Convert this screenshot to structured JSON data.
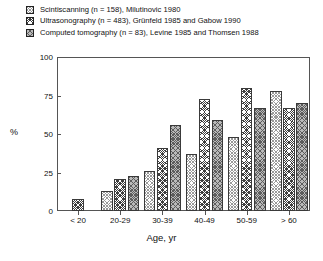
{
  "chart_data": {
    "type": "bar",
    "title": "",
    "xlabel": "Age, yr",
    "ylabel": "%",
    "ylim": [
      0,
      100
    ],
    "yticks": [
      0,
      25,
      50,
      75,
      100
    ],
    "grid": false,
    "legend_position": "top-left",
    "categories": [
      "< 20",
      "20-29",
      "30-39",
      "40-49",
      "50-59",
      "> 60"
    ],
    "series": [
      {
        "name": "Scintiscanning (n = 158), Milutinovic 1980",
        "short_name": "Scintiscanning",
        "n": 158,
        "source": "Milutinovic 1980",
        "pattern": "light-crosshatch",
        "values": [
          null,
          13,
          26,
          37,
          48,
          78
        ]
      },
      {
        "name": "Ultrasonography (n = 483), Grünfeld 1985 and Gabow 1990",
        "short_name": "Ultrasonography",
        "n": 483,
        "source": "Grünfeld 1985 and Gabow 1990",
        "pattern": "dark-crosshatch",
        "values": [
          8,
          21,
          41,
          73,
          80,
          67
        ]
      },
      {
        "name": "Computed tomography (n = 83), Levine 1985 and Thomsen 1988",
        "short_name": "Computed tomography",
        "n": 83,
        "source": "Levine 1985 and Thomsen 1988",
        "pattern": "mid-crosshatch",
        "values": [
          null,
          23,
          56,
          59,
          67,
          70
        ]
      }
    ]
  },
  "legend": {
    "items": [
      {
        "label": "Scintiscanning (n = 158), Milutinovic 1980",
        "swatch": "light-crosshatch-swatch"
      },
      {
        "label": "Ultrasonography (n = 483), Grünfeld 1985 and Gabow 1990",
        "swatch": "dark-crosshatch-swatch"
      },
      {
        "label": "Computed tomography (n = 83), Levine 1985 and Thomsen 1988",
        "swatch": "mid-crosshatch-swatch"
      }
    ]
  },
  "axes": {
    "y_title": "%",
    "x_title": "Age, yr",
    "y_tick_labels": [
      "100",
      "75",
      "50",
      "25",
      "0"
    ],
    "x_tick_labels": [
      "< 20",
      "20-29",
      "30-39",
      "40-49",
      "50-59",
      "> 60"
    ]
  },
  "colors": {
    "axis": "#555555",
    "text": "#111111",
    "background": "#ffffff",
    "series_light": "#c9c9c9",
    "series_dark": "#3e3e3e",
    "series_mid": "#9a9a9a"
  }
}
